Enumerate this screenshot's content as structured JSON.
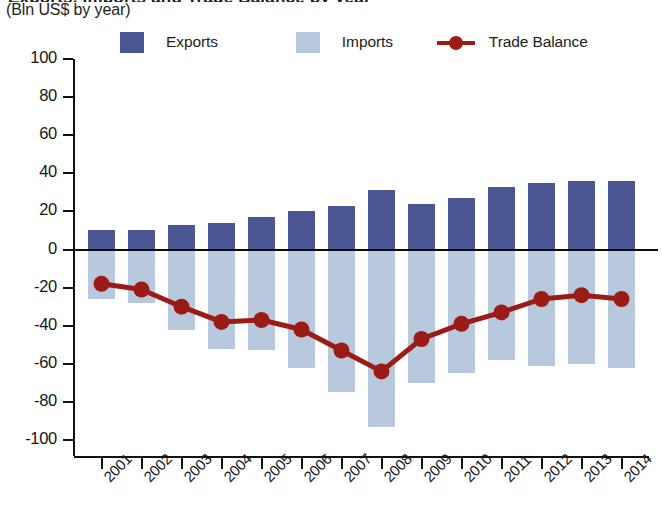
{
  "header": {
    "title_cropped": "Exports, Imports and Trade Balance by year",
    "subtitle": "(Bln US$ by year)"
  },
  "legend": {
    "items": [
      {
        "label": "Exports",
        "type": "swatch",
        "color": "#4a5691"
      },
      {
        "label": "Imports",
        "type": "swatch",
        "color": "#b9c9dd"
      },
      {
        "label": "Trade Balance",
        "type": "line",
        "color": "#9b1c16"
      }
    ]
  },
  "chart_data": {
    "type": "bar",
    "title": "Exports, Imports and Trade Balance by year",
    "subtitle": "(Bln US$ by year)",
    "xlabel": "",
    "ylabel": "Bln US$ by year",
    "ylim": [
      -100,
      100
    ],
    "yticks": [
      100,
      80,
      60,
      40,
      20,
      0,
      -20,
      -40,
      -60,
      -80,
      -100
    ],
    "ytick_labels": [
      "100",
      "80",
      "60",
      "40",
      "20",
      "0",
      "-20",
      "-40",
      "-60",
      "-80",
      "-100"
    ],
    "grid": false,
    "legend_position": "top",
    "categories": [
      "2001",
      "2002",
      "2003",
      "2004",
      "2005",
      "2006",
      "2007",
      "2008",
      "2009",
      "2010",
      "2011",
      "2012",
      "2013",
      "2014"
    ],
    "series": [
      {
        "name": "Exports",
        "kind": "bar",
        "color": "#4a5691",
        "values": [
          10,
          10,
          13,
          14,
          17,
          20,
          23,
          31,
          24,
          27,
          33,
          35,
          36,
          36
        ]
      },
      {
        "name": "Imports",
        "kind": "bar",
        "color": "#b9c9dd",
        "values": [
          -26,
          -28,
          -42,
          -52,
          -53,
          -62,
          -75,
          -93,
          -70,
          -65,
          -58,
          -61,
          -60,
          -62
        ]
      },
      {
        "name": "Trade Balance",
        "kind": "line",
        "color": "#9b1c16",
        "values": [
          -18,
          -21,
          -30,
          -38,
          -37,
          -42,
          -53,
          -64,
          -47,
          -39,
          -33,
          -26,
          -24,
          -26
        ]
      }
    ]
  },
  "colors": {
    "exports": "#4a5691",
    "imports": "#b9c9dd",
    "balance": "#9b1c16",
    "axis": "#111111",
    "background": "#ffffff"
  }
}
